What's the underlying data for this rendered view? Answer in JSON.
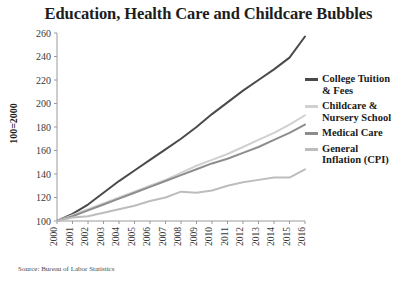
{
  "chart_data": {
    "type": "line",
    "title": "Education, Health Care and Childcare Bubbles",
    "xlabel": "",
    "ylabel": "100=2000",
    "source": "Source: Bureau of Labor Statistics",
    "grid": false,
    "legend_position": "right",
    "xlim": [
      2000,
      2016
    ],
    "ylim": [
      100,
      260
    ],
    "ytick_step": 20,
    "x": [
      2000,
      2001,
      2002,
      2003,
      2004,
      2005,
      2006,
      2007,
      2008,
      2009,
      2010,
      2011,
      2012,
      2013,
      2014,
      2015,
      2016
    ],
    "categories": [
      "2000",
      "2001",
      "2002",
      "2003",
      "2004",
      "2005",
      "2006",
      "2007",
      "2008",
      "2009",
      "2010",
      "2011",
      "2012",
      "2013",
      "2014",
      "2015",
      "2016"
    ],
    "yticks": [
      100,
      120,
      140,
      160,
      180,
      200,
      220,
      240,
      260
    ],
    "series": [
      {
        "name": "College Tuition & Fees",
        "color": "#4a4a4a",
        "values": [
          100,
          106,
          114,
          124,
          134,
          143,
          152,
          161,
          170,
          180,
          191,
          201,
          211,
          220,
          229,
          239,
          257
        ]
      },
      {
        "name": "Childcare & Nursery School",
        "color": "#d0d0d0",
        "values": [
          100,
          105,
          110,
          115,
          120,
          125,
          130,
          135,
          141,
          147,
          152,
          157,
          163,
          169,
          175,
          182,
          190
        ]
      },
      {
        "name": "Medical Care",
        "color": "#8d8d8d",
        "values": [
          100,
          104,
          109,
          114,
          119,
          124,
          129,
          134,
          139,
          144,
          149,
          153,
          158,
          163,
          169,
          175,
          182
        ]
      },
      {
        "name": "General Inflation (CPI)",
        "color": "#bdbdbd",
        "values": [
          100,
          103,
          104,
          107,
          110,
          113,
          117,
          120,
          125,
          124,
          126,
          130,
          133,
          135,
          137,
          137,
          144
        ]
      }
    ]
  },
  "legend": {
    "items": [
      {
        "label": "College Tuition\n& Fees",
        "color": "#4a4a4a"
      },
      {
        "label": "Childcare &\nNursery School",
        "color": "#d0d0d0"
      },
      {
        "label": "Medical Care",
        "color": "#8d8d8d"
      },
      {
        "label": "General\nInflation (CPI)",
        "color": "#bdbdbd"
      }
    ]
  }
}
